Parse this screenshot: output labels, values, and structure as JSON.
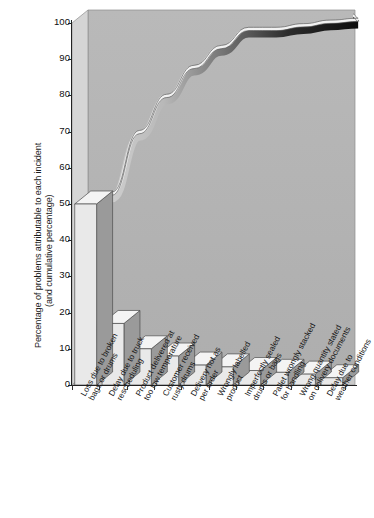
{
  "chart_data": {
    "type": "bar",
    "title": "",
    "subtitle": "",
    "xlabel": "",
    "ylabel": "Percentage of problems attributable to each incident (and cumulative percentage)",
    "ylabel_lines": [
      "Percentage of problems attributable to each incident",
      "(and cumulative percentage)"
    ],
    "ylim": [
      0,
      100
    ],
    "yticks": [
      0,
      10,
      20,
      30,
      40,
      50,
      60,
      70,
      80,
      90,
      100
    ],
    "grid": false,
    "legend": "none",
    "style": "3d-pareto",
    "categories": [
      "Loss due to broken bags or drums",
      "Delay due to truck rescheduling",
      "Product delivered at too low temperature",
      "Customer received rusty drums",
      "Delivery not as per order",
      "Wrongly labelled product",
      "Imperfectly sealed drums or bags",
      "Pallet wrongly stacked for handling",
      "Wrong quantity stated on delivery documents",
      "Delay due to weather conditions"
    ],
    "category_lines": [
      [
        "Loss due to broken",
        "bags or drums"
      ],
      [
        "Delay due to truck",
        "rescheduling"
      ],
      [
        "Product delivered at",
        "too low temperature"
      ],
      [
        "Customer received",
        "rusty drums"
      ],
      [
        "Delivery not as",
        "per order"
      ],
      [
        "Wrongly labelled",
        "product"
      ],
      [
        "Imperfectly sealed",
        "drums or bags"
      ],
      [
        "Pallet wrongly stacked",
        "for handling"
      ],
      [
        "Wrong quantity stated",
        "on delivery documents"
      ],
      [
        "Delay due to",
        "weather conditions"
      ]
    ],
    "values": [
      50,
      17,
      10,
      8,
      5.5,
      5,
      4,
      3.5,
      3,
      2
    ],
    "cumulative": [
      50,
      67,
      77,
      85,
      90.5,
      95.5,
      95.5,
      96.5,
      97.5,
      98
    ],
    "cumulative_series_name": "Cumulative percentage",
    "colors": {
      "bar_front": "#e9e9e9",
      "bar_side": "#9a9a9a",
      "bar_top": "#f4f4f4",
      "plot_back": "#b4b4b4",
      "plot_floor": "#cfcfcf",
      "curve_light": "#efefef",
      "curve_dark": "#151515",
      "axis": "#222222",
      "text": "#161616"
    }
  }
}
